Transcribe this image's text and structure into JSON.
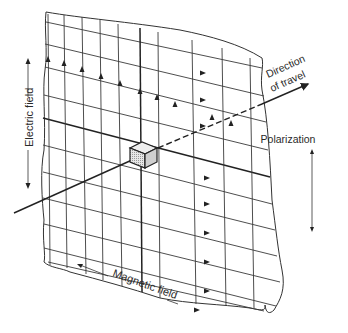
{
  "figure": {
    "labels": {
      "electric_field": "Electric field",
      "magnetic_field": "Magnetic field",
      "direction_line1": "Direction",
      "direction_line2": "of travel",
      "polarization": "Polarization"
    },
    "colors": {
      "ink": "#2a2a2a",
      "background": "#ffffff",
      "cube_fill": "#d8d8d8"
    },
    "elements": {
      "vertical_field_lines": 10,
      "horizontal_field_lines": 11,
      "upward_arrows_on_electric_lines": 10,
      "rightward_arrows_on_magnetic_lines": 10,
      "center_element": "cube"
    }
  }
}
